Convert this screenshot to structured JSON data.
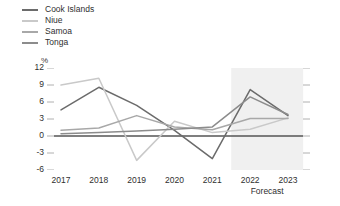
{
  "chart_data": {
    "type": "line",
    "title": "",
    "subtitle": "",
    "xlabel": "",
    "ylabel": "%",
    "unit": "%",
    "grid": false,
    "legend_position": "top-left",
    "categories": [
      "2017",
      "2018",
      "2019",
      "2020",
      "2021",
      "2022",
      "2023"
    ],
    "x": [
      2017,
      2018,
      2019,
      2020,
      2021,
      2022,
      2023
    ],
    "ylim": [
      -6,
      12
    ],
    "yticks": [
      12,
      9,
      6,
      3,
      0,
      -3,
      -6
    ],
    "ytick_labels": [
      "12",
      "9",
      "6",
      "3",
      "0",
      "-3",
      "-6"
    ],
    "zero_line": 0,
    "forecast_label": "Forecast",
    "forecast_start": 2021.5,
    "forecast_end": 2023.4,
    "series": [
      {
        "name": "Cook Islands",
        "color": "#6b6b6b",
        "values": [
          4.6,
          8.6,
          5.4,
          1.0,
          -4.0,
          8.2,
          3.6
        ]
      },
      {
        "name": "Niue",
        "color": "#c9c9c9",
        "values": [
          9.0,
          10.2,
          -4.3,
          2.6,
          0.6,
          1.2,
          3.2
        ]
      },
      {
        "name": "Samoa",
        "color": "#a8a8a8",
        "values": [
          1.0,
          1.4,
          3.6,
          1.6,
          1.1,
          3.1,
          3.1
        ]
      },
      {
        "name": "Tonga",
        "color": "#8c8c8c",
        "values": [
          0.4,
          0.6,
          0.9,
          1.2,
          1.6,
          6.9,
          3.8
        ]
      }
    ]
  },
  "legend": {
    "items": [
      {
        "label": "Cook Islands",
        "color": "#6b6b6b"
      },
      {
        "label": "Niue",
        "color": "#c9c9c9"
      },
      {
        "label": "Samoa",
        "color": "#a8a8a8"
      },
      {
        "label": "Tonga",
        "color": "#8c8c8c"
      }
    ]
  },
  "axes": {
    "unit": "%",
    "y_labels": [
      "12",
      "9",
      "6",
      "3",
      "0",
      "-3",
      "-6"
    ],
    "x_labels": [
      "2017",
      "2018",
      "2019",
      "2020",
      "2021",
      "2022",
      "2023"
    ],
    "forecast_label": "Forecast"
  },
  "colors": {
    "zero_line": "#555555",
    "tick": "#b0b0b0",
    "forecast_band": "#f0f0f0",
    "text": "#2f2f2f"
  }
}
